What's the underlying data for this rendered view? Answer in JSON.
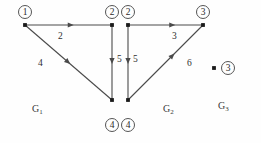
{
  "figure": {
    "width": 261,
    "height": 143,
    "background": "#fefefe",
    "edge_color": "#4a4a4a",
    "vertex_color": "#1a1a1a",
    "text_color": "#2b2b2b"
  },
  "graphs": [
    {
      "id": "G1",
      "caption": "G",
      "caption_sub": "1",
      "caption_pos": {
        "x": 32,
        "y": 103
      },
      "vertices": [
        {
          "id": "v1",
          "label": "1",
          "x": 25,
          "y": 25,
          "label_x": 18,
          "label_y": 5
        },
        {
          "id": "v2",
          "label": "2",
          "x": 112,
          "y": 25,
          "label_x": 105,
          "label_y": 5
        },
        {
          "id": "v4",
          "label": "4",
          "x": 112,
          "y": 100,
          "label_x": 105,
          "label_y": 118
        }
      ],
      "edges": [
        {
          "from": "v1",
          "to": "v2",
          "weight": "2",
          "weight_x": 58,
          "weight_y": 31,
          "arrow_t": 0.56
        },
        {
          "from": "v1",
          "to": "v4",
          "weight": "4",
          "weight_x": 38,
          "weight_y": 58,
          "arrow_t": 0.52
        },
        {
          "from": "v2",
          "to": "v4",
          "weight": "5",
          "weight_x": 117,
          "weight_y": 54,
          "arrow_t": 0.52
        }
      ]
    },
    {
      "id": "G2",
      "caption": "G",
      "caption_sub": "2",
      "caption_pos": {
        "x": 163,
        "y": 103
      },
      "vertices": [
        {
          "id": "v2",
          "label": "2",
          "x": 128,
          "y": 25,
          "label_x": 121,
          "label_y": 5
        },
        {
          "id": "v3",
          "label": "3",
          "x": 203,
          "y": 25,
          "label_x": 196,
          "label_y": 5
        },
        {
          "id": "v4",
          "label": "4",
          "x": 128,
          "y": 100,
          "label_x": 121,
          "label_y": 118
        }
      ],
      "edges": [
        {
          "from": "v2",
          "to": "v3",
          "weight": "3",
          "weight_x": 172,
          "weight_y": 31,
          "arrow_t": 0.63
        },
        {
          "from": "v2",
          "to": "v4",
          "weight": "5",
          "weight_x": 133,
          "weight_y": 54,
          "arrow_t": 0.52
        },
        {
          "from": "v4",
          "to": "v3",
          "weight": "6",
          "weight_x": 187,
          "weight_y": 58,
          "arrow_t": 0.62
        }
      ]
    },
    {
      "id": "G3",
      "caption": "G",
      "caption_sub": "3",
      "caption_pos": {
        "x": 218,
        "y": 100
      },
      "vertices": [
        {
          "id": "v3",
          "label": "3",
          "x": 214,
          "y": 68,
          "label_x": 221,
          "label_y": 61
        }
      ],
      "edges": []
    }
  ]
}
